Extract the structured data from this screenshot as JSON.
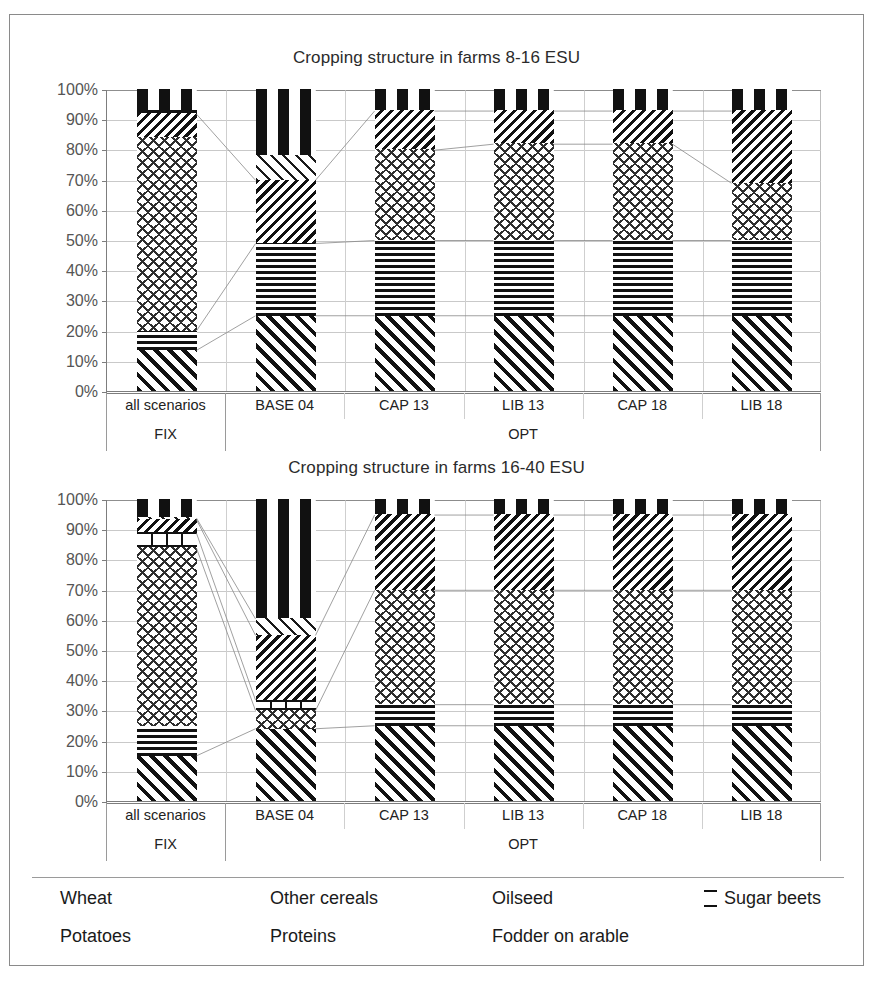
{
  "figure": {
    "outer_border": true,
    "background": "#ffffff"
  },
  "charts": [
    {
      "title": "Cropping structure  in farms  8-16 ESU"
    },
    {
      "title": "Cropping structure  in farms  16-40 ESU"
    }
  ],
  "axis": {
    "y_ticks": [
      "100%",
      "90%",
      "80%",
      "70%",
      "60%",
      "50%",
      "40%",
      "30%",
      "20%",
      "10%",
      "0%"
    ],
    "y_values": [
      100,
      90,
      80,
      70,
      60,
      50,
      40,
      30,
      20,
      10,
      0
    ],
    "ylim": [
      0,
      100
    ]
  },
  "categories": [
    "all scenarios",
    "BASE 04",
    "CAP 13",
    "LIB 13",
    "CAP 18",
    "LIB 18"
  ],
  "groups": [
    {
      "label": "FIX",
      "span": [
        0,
        1
      ]
    },
    {
      "label": "OPT",
      "span": [
        1,
        6
      ]
    }
  ],
  "legend": {
    "row1": [
      {
        "label": "Wheat",
        "pattern": "wheat",
        "glyph": "wheat-swatch"
      },
      {
        "label": "Other cereals",
        "pattern": "othercereals",
        "glyph": "other-cereals-swatch"
      },
      {
        "label": "Oilseed",
        "pattern": "oilseed",
        "glyph": "oilseed-swatch"
      },
      {
        "label": "Sugar beets",
        "pattern": "sugar",
        "glyph": "sugar-beets-swatch"
      }
    ],
    "row2": [
      {
        "label": "Potatoes",
        "pattern": "potatoes",
        "glyph": "potatoes-swatch"
      },
      {
        "label": "Proteins",
        "pattern": "proteins-solid",
        "glyph": "proteins-swatch"
      },
      {
        "label": "Fodder on arable",
        "pattern": "fodder",
        "glyph": "fodder-swatch"
      }
    ]
  },
  "chart_data": [
    {
      "type": "bar",
      "stacked": true,
      "title": "Cropping structure  in farms  8-16 ESU",
      "xlabel": "",
      "ylabel": "",
      "ylim": [
        0,
        100
      ],
      "grid": true,
      "legend_position": "bottom",
      "categories": [
        "all scenarios",
        "BASE 04",
        "CAP 13",
        "LIB 13",
        "CAP 18",
        "LIB 18"
      ],
      "series": [
        {
          "name": "Wheat",
          "values": [
            13.5,
            25.0,
            25.0,
            25.0,
            25.0,
            25.0
          ]
        },
        {
          "name": "Proteins",
          "values": [
            6.5,
            24.0,
            25.0,
            25.0,
            25.0,
            25.0
          ]
        },
        {
          "name": "Other cereals",
          "values": [
            64.0,
            0.0,
            30.0,
            32.0,
            32.0,
            19.0
          ]
        },
        {
          "name": "Oilseed",
          "values": [
            8.0,
            21.0,
            13.0,
            11.0,
            11.0,
            24.0
          ]
        },
        {
          "name": "Sugar beets",
          "values": [
            1.0,
            0.0,
            0.0,
            0.0,
            0.0,
            0.0
          ]
        },
        {
          "name": "Potatoes",
          "values": [
            0.0,
            8.0,
            0.0,
            0.0,
            0.0,
            0.0
          ]
        },
        {
          "name": "Fodder on arable",
          "values": [
            7.0,
            22.0,
            7.0,
            7.0,
            7.0,
            7.0
          ]
        }
      ]
    },
    {
      "type": "bar",
      "stacked": true,
      "title": "Cropping structure  in farms  16-40 ESU",
      "xlabel": "",
      "ylabel": "",
      "ylim": [
        0,
        100
      ],
      "grid": true,
      "legend_position": "bottom",
      "categories": [
        "all scenarios",
        "BASE 04",
        "CAP 13",
        "LIB 13",
        "CAP 18",
        "LIB 18"
      ],
      "series": [
        {
          "name": "Wheat",
          "values": [
            15.0,
            24.0,
            25.0,
            25.0,
            25.0,
            25.0
          ]
        },
        {
          "name": "Proteins",
          "values": [
            10.0,
            0.0,
            7.0,
            7.0,
            7.0,
            7.0
          ]
        },
        {
          "name": "Other cereals",
          "values": [
            59.0,
            6.0,
            38.0,
            38.0,
            38.0,
            38.0
          ]
        },
        {
          "name": "Sugar beets",
          "values": [
            5.0,
            3.5,
            0.0,
            0.0,
            0.0,
            0.0
          ]
        },
        {
          "name": "Oilseed",
          "values": [
            4.5,
            21.5,
            25.0,
            25.0,
            25.0,
            25.0
          ]
        },
        {
          "name": "Potatoes",
          "values": [
            0.5,
            5.5,
            0.0,
            0.0,
            0.0,
            0.0
          ]
        },
        {
          "name": "Fodder on arable",
          "values": [
            6.0,
            39.5,
            5.0,
            5.0,
            5.0,
            5.0
          ]
        }
      ]
    }
  ]
}
